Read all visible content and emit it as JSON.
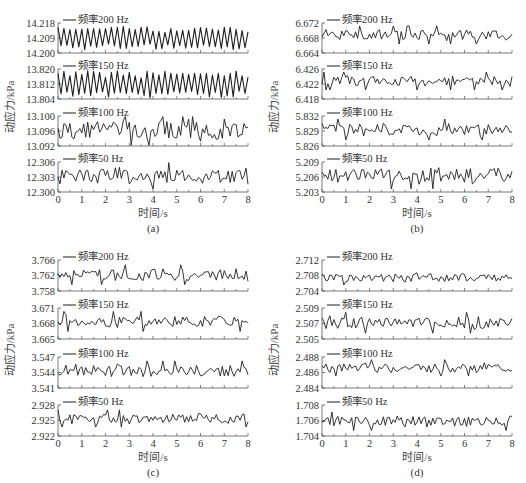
{
  "figure": {
    "ylabel": "动应力/kPa",
    "xlabel": "时间/s",
    "line_color": "#1f1f1f",
    "axis_color": "#555555"
  },
  "chart_data": [
    {
      "panel": "(a)",
      "type": "line",
      "xlabel": "时间/s",
      "ylabel": "动应力/kPa",
      "x_ticks": [
        "0",
        "1",
        "2",
        "3",
        "4",
        "5",
        "6",
        "7",
        "8"
      ],
      "xlim": [
        0,
        8
      ],
      "subplots": [
        {
          "legend": "频率200 Hz",
          "y_ticks": [
            "14.218",
            "14.209",
            "14.200"
          ],
          "ylim": [
            14.2,
            14.218
          ],
          "mean": 14.209,
          "amplitude": 0.007,
          "style": "periodic",
          "seed": 11
        },
        {
          "legend": "频率150 Hz",
          "y_ticks": [
            "13.820",
            "13.812",
            "13.804"
          ],
          "ylim": [
            13.804,
            13.82
          ],
          "mean": 13.812,
          "amplitude": 0.007,
          "style": "periodic",
          "seed": 12
        },
        {
          "legend": "频率100 Hz",
          "y_ticks": [
            "13.100",
            "13.096",
            "13.092"
          ],
          "ylim": [
            13.092,
            13.1
          ],
          "mean": 13.0963,
          "amplitude": 0.0028,
          "style": "noise",
          "seed": 13
        },
        {
          "legend": "频率50 Hz",
          "y_ticks": [
            "12.306",
            "12.303",
            "12.300"
          ],
          "ylim": [
            12.3,
            12.306
          ],
          "mean": 12.3033,
          "amplitude": 0.0018,
          "style": "noise",
          "seed": 14
        }
      ]
    },
    {
      "panel": "(b)",
      "type": "line",
      "xlabel": "时间/s",
      "ylabel": "动应力/kPa",
      "x_ticks": [
        "0",
        "1",
        "2",
        "3",
        "4",
        "5",
        "6",
        "7",
        "8"
      ],
      "xlim": [
        0,
        8
      ],
      "subplots": [
        {
          "legend": "频率200 Hz",
          "y_ticks": [
            "6.672",
            "6.668",
            "6.664"
          ],
          "ylim": [
            6.664,
            6.672
          ],
          "mean": 6.6688,
          "amplitude": 0.0016,
          "style": "noise",
          "seed": 21
        },
        {
          "legend": "频率150 Hz",
          "y_ticks": [
            "6.426",
            "6.422",
            "6.418"
          ],
          "ylim": [
            6.418,
            6.426
          ],
          "mean": 6.4228,
          "amplitude": 0.0016,
          "style": "noise",
          "seed": 22
        },
        {
          "legend": "频率100 Hz",
          "y_ticks": [
            "5.832",
            "5.829",
            "5.826"
          ],
          "ylim": [
            5.826,
            5.832
          ],
          "mean": 5.8293,
          "amplitude": 0.0014,
          "style": "noise",
          "seed": 23
        },
        {
          "legend": "频率50 Hz",
          "y_ticks": [
            "5.209",
            "5.206",
            "5.203"
          ],
          "ylim": [
            5.203,
            5.209
          ],
          "mean": 5.2062,
          "amplitude": 0.0017,
          "style": "noise",
          "seed": 24
        }
      ]
    },
    {
      "panel": "(c)",
      "type": "line",
      "xlabel": "时间/s",
      "ylabel": "动应力/kPa",
      "x_ticks": [
        "0",
        "1",
        "2",
        "3",
        "4",
        "5",
        "6",
        "7",
        "8"
      ],
      "xlim": [
        0,
        8
      ],
      "subplots": [
        {
          "legend": "频率200 Hz",
          "y_ticks": [
            "3.766",
            "3.762",
            "3.758"
          ],
          "ylim": [
            3.758,
            3.766
          ],
          "mean": 3.7622,
          "amplitude": 0.0017,
          "style": "noise",
          "seed": 31
        },
        {
          "legend": "频率150 Hz",
          "y_ticks": [
            "3.671",
            "3.668",
            "3.665"
          ],
          "ylim": [
            3.665,
            3.671
          ],
          "mean": 3.6684,
          "amplitude": 0.0013,
          "style": "noise",
          "seed": 32
        },
        {
          "legend": "频率100 Hz",
          "y_ticks": [
            "3.547",
            "3.544",
            "3.541"
          ],
          "ylim": [
            3.541,
            3.547
          ],
          "mean": 3.5443,
          "amplitude": 0.0013,
          "style": "noise",
          "seed": 33
        },
        {
          "legend": "频率50 Hz",
          "y_ticks": [
            "2.928",
            "2.925",
            "2.922"
          ],
          "ylim": [
            2.922,
            2.928
          ],
          "mean": 2.9254,
          "amplitude": 0.0011,
          "style": "noise",
          "seed": 34
        }
      ]
    },
    {
      "panel": "(d)",
      "type": "line",
      "xlabel": "时间/s",
      "ylabel": "动应力/kPa",
      "x_ticks": [
        "0",
        "1",
        "2",
        "3",
        "4",
        "5",
        "6",
        "7",
        "8"
      ],
      "xlim": [
        0,
        8
      ],
      "subplots": [
        {
          "legend": "频率200 Hz",
          "y_ticks": [
            "2.712",
            "2.708",
            "2.704"
          ],
          "ylim": [
            2.704,
            2.712
          ],
          "mean": 2.7075,
          "amplitude": 0.0013,
          "style": "noise",
          "seed": 41
        },
        {
          "legend": "频率150 Hz",
          "y_ticks": [
            "2.509",
            "2.507",
            "2.505"
          ],
          "ylim": [
            2.505,
            2.509
          ],
          "mean": 2.5071,
          "amplitude": 0.0009,
          "style": "noise",
          "seed": 42
        },
        {
          "legend": "频率100 Hz",
          "y_ticks": [
            "2.488",
            "2.486",
            "2.484"
          ],
          "ylim": [
            2.484,
            2.488
          ],
          "mean": 2.4866,
          "amplitude": 0.0007,
          "style": "noise",
          "seed": 43
        },
        {
          "legend": "频率50 Hz",
          "y_ticks": [
            "1.708",
            "1.706",
            "1.704"
          ],
          "ylim": [
            1.704,
            1.708
          ],
          "mean": 1.7059,
          "amplitude": 0.0008,
          "style": "noise",
          "seed": 44
        }
      ]
    }
  ]
}
